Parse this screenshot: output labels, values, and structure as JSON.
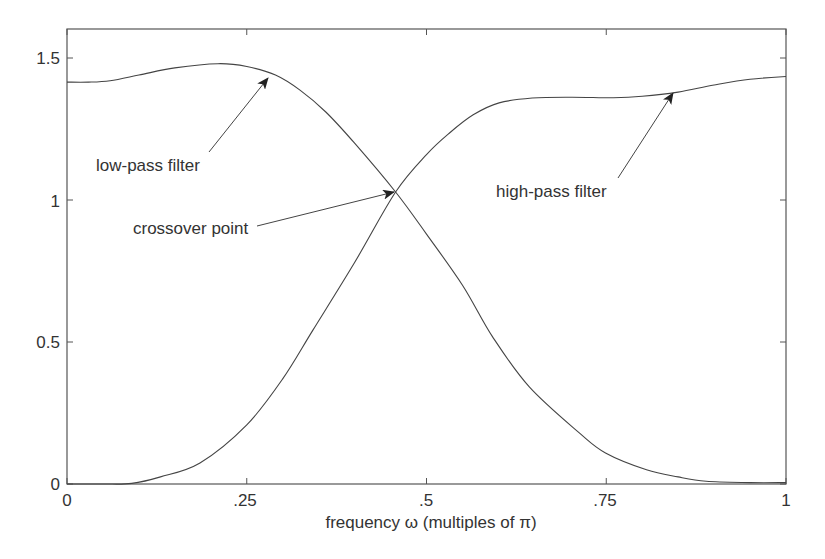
{
  "chart_data": {
    "type": "line",
    "title": "",
    "xlabel": "frequency ω (multiples of π)",
    "ylabel": "",
    "xlim": [
      0,
      1
    ],
    "ylim": [
      0,
      1.6
    ],
    "grid": false,
    "legend": null,
    "x_ticks": [
      {
        "value": 0,
        "label": "0"
      },
      {
        "value": 0.25,
        "label": ".25"
      },
      {
        "value": 0.5,
        "label": ".5"
      },
      {
        "value": 0.75,
        "label": ".75"
      },
      {
        "value": 1,
        "label": "1"
      }
    ],
    "y_ticks": [
      {
        "value": 0,
        "label": "0"
      },
      {
        "value": 0.5,
        "label": "0.5"
      },
      {
        "value": 1,
        "label": "1"
      },
      {
        "value": 1.5,
        "label": "1.5"
      }
    ],
    "series": [
      {
        "name": "low-pass filter",
        "x": [
          0,
          0.03,
          0.06,
          0.1,
          0.15,
          0.21,
          0.25,
          0.29,
          0.324,
          0.36,
          0.4,
          0.457,
          0.5,
          0.55,
          0.592,
          0.643,
          0.7125,
          0.749,
          0.806,
          0.85,
          0.889,
          0.95,
          1
        ],
        "values": [
          1.415,
          1.415,
          1.42,
          1.44,
          1.465,
          1.48,
          1.47,
          1.44,
          1.387,
          1.31,
          1.2,
          1.028,
          0.88,
          0.7,
          0.518,
          0.342,
          0.18,
          0.109,
          0.05,
          0.025,
          0.01,
          0.005,
          0.005
        ]
      },
      {
        "name": "high-pass filter",
        "x": [
          0,
          0.05,
          0.09,
          0.13,
          0.185,
          0.25,
          0.3,
          0.342,
          0.4,
          0.457,
          0.5,
          0.532,
          0.565,
          0.601,
          0.647,
          0.7,
          0.76,
          0.8,
          0.85,
          0.9,
          0.95,
          1
        ],
        "values": [
          0,
          0,
          0.002,
          0.025,
          0.074,
          0.208,
          0.37,
          0.542,
          0.78,
          1.028,
          1.16,
          1.236,
          1.3,
          1.342,
          1.359,
          1.362,
          1.36,
          1.365,
          1.38,
          1.405,
          1.425,
          1.435
        ]
      }
    ],
    "annotations": [
      {
        "text": "low-pass filter",
        "arrow_to": [
          0.28,
          1.44
        ]
      },
      {
        "text": "crossover point",
        "arrow_to": [
          0.457,
          1.028
        ]
      },
      {
        "text": "high-pass filter",
        "arrow_to": [
          0.843,
          1.385
        ]
      }
    ]
  },
  "labels": {
    "xlabel": "frequency ω (multiples of π)",
    "annot_lowpass": "low-pass filter",
    "annot_crossover": "crossover point",
    "annot_highpass": "high-pass filter",
    "xt0": "0",
    "xt1": ".25",
    "xt2": ".5",
    "xt3": ".75",
    "xt4": "1",
    "yt0": "0",
    "yt1": "0.5",
    "yt2": "1",
    "yt3": "1.5"
  }
}
